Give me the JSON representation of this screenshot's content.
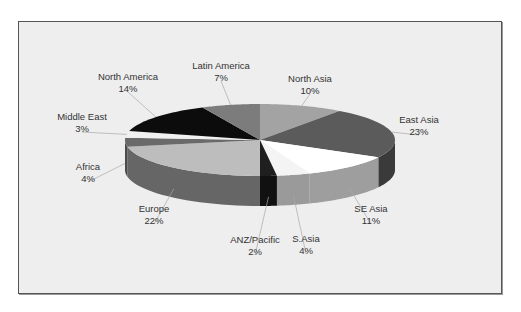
{
  "chart_data": {
    "type": "pie",
    "title": "",
    "style": "3d-pie",
    "start_angle": "12 o'clock",
    "direction": "clockwise",
    "legend": "none (data labels with leader lines)",
    "categories": [
      "North Asia",
      "East Asia",
      "SE Asia",
      "S.Asia",
      "ANZ/Pacific",
      "Europe",
      "Africa",
      "Middle East",
      "North America",
      "Latin America"
    ],
    "values": [
      10,
      23,
      11,
      4,
      2,
      22,
      4,
      3,
      14,
      7
    ],
    "labels": [
      "10%",
      "23%",
      "11%",
      "4%",
      "2%",
      "22%",
      "4%",
      "3%",
      "14%",
      "7%"
    ],
    "colors_top": [
      "#a3a3a3",
      "#5b5b5b",
      "#ffffff",
      "#f4f4f4",
      "#1f1f1f",
      "#bdbdbd",
      "#6a6a6a",
      "#f0f0f0",
      "#0c0c0c",
      "#7c7c7c"
    ],
    "colors_side": [
      "#8a8a8a",
      "#3a3a3a",
      "#9e9e9e",
      "#9a9a9a",
      "#111111",
      "#666666",
      "#4b4b4b",
      "#c8c8c8",
      "#050505",
      "#5e5e5e"
    ]
  },
  "slices": [
    {
      "name": "North Asia",
      "pct": "10%",
      "lx": 310,
      "ly": 82
    },
    {
      "name": "East Asia",
      "pct": "23%",
      "lx": 419,
      "ly": 123
    },
    {
      "name": "SE Asia",
      "pct": "11%",
      "lx": 371,
      "ly": 212
    },
    {
      "name": "S.Asia",
      "pct": "4%",
      "lx": 306,
      "ly": 242
    },
    {
      "name": "ANZ/Pacific",
      "pct": "2%",
      "lx": 255,
      "ly": 243
    },
    {
      "name": "Europe",
      "pct": "22%",
      "lx": 154,
      "ly": 212
    },
    {
      "name": "Africa",
      "pct": "4%",
      "lx": 88,
      "ly": 170
    },
    {
      "name": "Middle East",
      "pct": "3%",
      "lx": 82,
      "ly": 120
    },
    {
      "name": "North America",
      "pct": "14%",
      "lx": 128,
      "ly": 80
    },
    {
      "name": "Latin America",
      "pct": "7%",
      "lx": 221,
      "ly": 69
    }
  ]
}
